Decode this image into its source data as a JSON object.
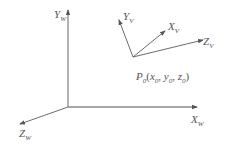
{
  "diagram": {
    "type": "coordinate-systems",
    "colors": {
      "axis": "#6b6b6b",
      "text": "#555555",
      "background": "#ffffff"
    },
    "world_frame": {
      "origin": [
        68,
        107
      ],
      "axes": [
        {
          "name": "Y",
          "sub": "W",
          "end": [
            68,
            10
          ]
        },
        {
          "name": "X",
          "sub": "W",
          "end": [
            197,
            107
          ]
        },
        {
          "name": "Z",
          "sub": "W",
          "end": [
            20,
            124
          ]
        }
      ]
    },
    "view_frame": {
      "origin": [
        133,
        57
      ],
      "axes": [
        {
          "name": "Y",
          "sub": "V",
          "end": [
            119,
            20
          ]
        },
        {
          "name": "X",
          "sub": "V",
          "end": [
            165,
            31
          ]
        },
        {
          "name": "Z",
          "sub": "V",
          "end": [
            203,
            40
          ]
        }
      ]
    },
    "point": {
      "name": "P",
      "sub": "0",
      "coords": [
        {
          "name": "x",
          "sub": "0"
        },
        {
          "name": "y",
          "sub": "0"
        },
        {
          "name": "z",
          "sub": "0"
        }
      ]
    }
  }
}
